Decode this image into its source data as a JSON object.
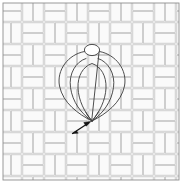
{
  "figure": {
    "caption": "",
    "canvas": {
      "width": 185,
      "height": 192
    },
    "background_color": "#ffffff"
  },
  "weave_panel": {
    "name": "basketweave-pattern-panel",
    "x": 3,
    "y": 3,
    "width": 176,
    "height": 177,
    "tile_fill": "#fbfbfb",
    "tile_stroke": "#b9b9b9",
    "tile_stroke_width": 0.7,
    "frame_stroke": "#8f8f8f",
    "frame_stroke_width": 0.9,
    "unit_size": 22,
    "brick_long": 20,
    "brick_short": 9.5,
    "columns": 8,
    "rows": 8
  },
  "cord_loop": {
    "name": "teardrop-cord-loop",
    "stroke": "#3a3a3a",
    "stroke_width": 0.9,
    "fill": "none",
    "apex_x": 92,
    "apex_y": 52,
    "point_x": 92,
    "point_y": 121,
    "outer_left_x": 60,
    "outer_right_x": 124,
    "inner_left_x": 72,
    "inner_right_x": 112,
    "widest_y": 86
  },
  "top_ring": {
    "name": "top-ring-grommet",
    "cx": 92,
    "cy": 50,
    "rx": 7.5,
    "ry": 5.5,
    "stroke": "#3a3a3a",
    "stroke_width": 0.9,
    "fill": "#ffffff"
  },
  "pointer_arrow": {
    "name": "annotation-arrow",
    "tail_x": 73,
    "tail_y": 133,
    "tip_x": 90,
    "tip_y": 122,
    "stroke": "#1a1a1a",
    "stroke_width": 1.2,
    "label": ""
  },
  "labels": {
    "figure_label": "",
    "arrow_label": ""
  }
}
